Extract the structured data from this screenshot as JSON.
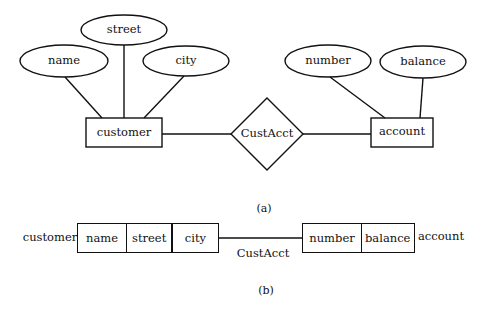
{
  "figure_a": {
    "caption": "(a)",
    "entities": [
      {
        "name": "customer",
        "attributes": [
          "name",
          "street",
          "city"
        ]
      },
      {
        "name": "account",
        "attributes": [
          "number",
          "balance"
        ]
      }
    ],
    "relationship": {
      "name": "CustAcct",
      "connects": [
        "customer",
        "account"
      ]
    },
    "labels": {
      "customer": "customer",
      "account": "account",
      "relationship": "CustAcct",
      "attr_name": "name",
      "attr_street": "street",
      "attr_city": "city",
      "attr_number": "number",
      "attr_balance": "balance"
    }
  },
  "figure_b": {
    "caption": "(b)",
    "left_record": {
      "label": "customer",
      "fields": [
        "name",
        "street",
        "city"
      ]
    },
    "right_record": {
      "label": "account",
      "fields": [
        "number",
        "balance"
      ]
    },
    "link_label": "CustAcct"
  },
  "colors": {
    "stroke": "#111111",
    "background": "#ffffff"
  }
}
